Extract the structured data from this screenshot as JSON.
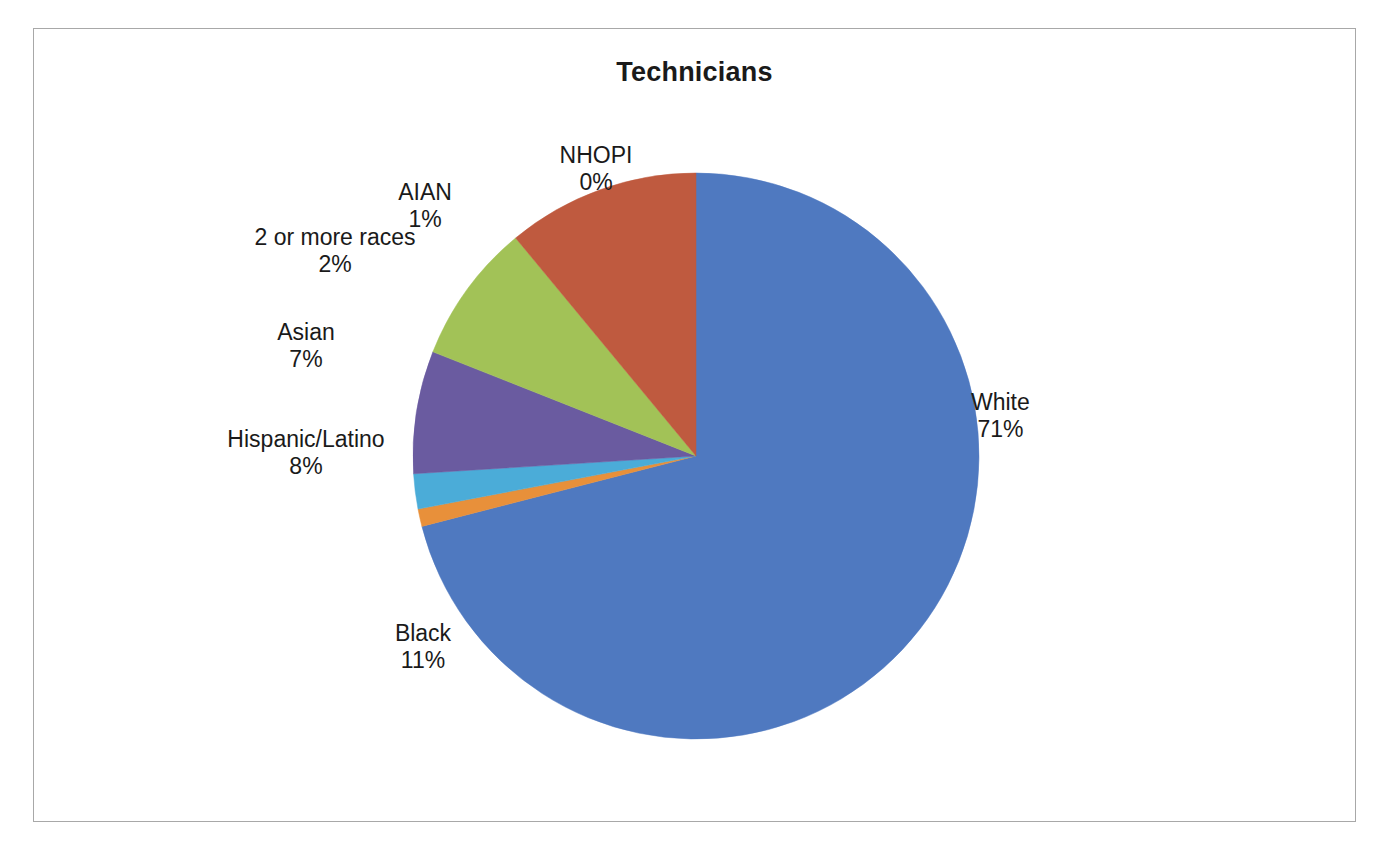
{
  "chart": {
    "title": "Technicians",
    "frame_border_color": "#a8a8a8",
    "background": "#ffffff"
  },
  "chart_data": {
    "type": "pie",
    "title": "Technicians",
    "xlabel": "",
    "ylabel": "",
    "legend_position": "none",
    "labels_outside": true,
    "categories": [
      "White",
      "AIAN",
      "2 or more races",
      "Asian",
      "Hispanic/Latino",
      "Black",
      "NHOPI"
    ],
    "values": [
      71,
      1,
      2,
      7,
      8,
      11,
      0
    ],
    "value_unit": "%",
    "slices": [
      {
        "name": "White",
        "pct_label": "71%",
        "value": 71,
        "color": "#4f79c0"
      },
      {
        "name": "AIAN",
        "pct_label": "1%",
        "value": 1,
        "color": "#e8903a"
      },
      {
        "name": "2 or more races",
        "pct_label": "2%",
        "value": 2,
        "color": "#4bacd8"
      },
      {
        "name": "Asian",
        "pct_label": "7%",
        "value": 7,
        "color": "#6a5ba0"
      },
      {
        "name": "Hispanic/Latino",
        "pct_label": "8%",
        "value": 8,
        "color": "#a2c257"
      },
      {
        "name": "Black",
        "pct_label": "11%",
        "value": 11,
        "color": "#bf5a3f"
      },
      {
        "name": "NHOPI",
        "pct_label": "0%",
        "value": 0,
        "color": "#4f79c0"
      }
    ],
    "label_nhopi_name": "NHOPI",
    "label_nhopi_pct": "0%",
    "label_aian_name": "AIAN",
    "label_aian_pct": "1%",
    "label_two_name": "2 or more races",
    "label_two_pct": "2%",
    "label_asian_name": "Asian",
    "label_asian_pct": "7%",
    "label_hispanic_name": "Hispanic/Latino",
    "label_hispanic_pct": "8%",
    "label_black_name": "Black",
    "label_black_pct": "11%",
    "label_white_name": "White",
    "label_white_pct": "71%"
  }
}
